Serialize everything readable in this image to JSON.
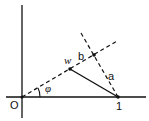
{
  "diagram": {
    "labels": {
      "origin": "O",
      "unit": "1",
      "w": "w",
      "b": "b",
      "a": "a",
      "phi": "φ"
    },
    "colors": {
      "stroke": "#111111",
      "background": "#ffffff"
    }
  }
}
